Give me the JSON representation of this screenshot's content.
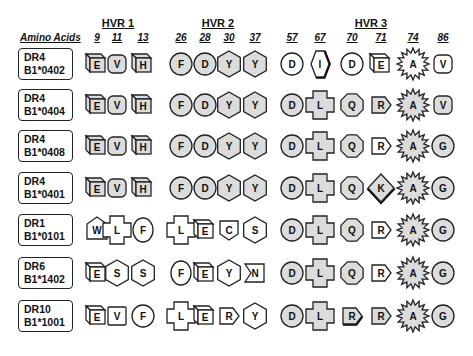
{
  "header": {
    "row_label_title": "Amino Acids",
    "regions": [
      {
        "label": "HVR 1",
        "x": 118
      },
      {
        "label": "HVR 2",
        "x": 218
      },
      {
        "label": "HVR 3",
        "x": 371
      }
    ],
    "positions": [
      {
        "label": "9",
        "x": 97
      },
      {
        "label": "11",
        "x": 117
      },
      {
        "label": "13",
        "x": 143
      },
      {
        "label": "26",
        "x": 181
      },
      {
        "label": "28",
        "x": 205
      },
      {
        "label": "30",
        "x": 229
      },
      {
        "label": "37",
        "x": 255
      },
      {
        "label": "57",
        "x": 292
      },
      {
        "label": "67",
        "x": 320
      },
      {
        "label": "70",
        "x": 352
      },
      {
        "label": "71",
        "x": 381
      },
      {
        "label": "74",
        "x": 413
      },
      {
        "label": "86",
        "x": 443
      }
    ]
  },
  "colors": {
    "shaded_fill": "#dcdcdc",
    "unshaded_fill": "#ffffff",
    "stroke": "#222222"
  },
  "alleles": [
    {
      "line1": "DR4",
      "line2": "B1*0402",
      "residues": [
        {
          "aa": "E",
          "shape": "cube",
          "shaded": true
        },
        {
          "aa": "V",
          "shape": "rounded",
          "shaded": true
        },
        {
          "aa": "H",
          "shape": "cube",
          "shaded": true
        },
        {
          "aa": "F",
          "shape": "circle",
          "shaded": true
        },
        {
          "aa": "D",
          "shape": "circle",
          "shaded": true
        },
        {
          "aa": "Y",
          "shape": "hexagon",
          "shaded": true
        },
        {
          "aa": "Y",
          "shape": "hexagon",
          "shaded": true
        },
        {
          "aa": "D",
          "shape": "circle",
          "shaded": false
        },
        {
          "aa": "I",
          "shape": "hexagon-bold",
          "shaded": false
        },
        {
          "aa": "D",
          "shape": "circle",
          "shaded": false
        },
        {
          "aa": "E",
          "shape": "cube",
          "shaded": false
        },
        {
          "aa": "A",
          "shape": "starburst",
          "shaded": false
        },
        {
          "aa": "V",
          "shape": "rounded",
          "shaded": false
        }
      ]
    },
    {
      "line1": "DR4",
      "line2": "B1*0404",
      "residues": [
        {
          "aa": "E",
          "shape": "cube",
          "shaded": true
        },
        {
          "aa": "V",
          "shape": "rounded",
          "shaded": true
        },
        {
          "aa": "H",
          "shape": "cube",
          "shaded": true
        },
        {
          "aa": "F",
          "shape": "circle",
          "shaded": true
        },
        {
          "aa": "D",
          "shape": "circle",
          "shaded": true
        },
        {
          "aa": "Y",
          "shape": "hexagon",
          "shaded": true
        },
        {
          "aa": "Y",
          "shape": "hexagon",
          "shaded": true
        },
        {
          "aa": "D",
          "shape": "circle",
          "shaded": true
        },
        {
          "aa": "L",
          "shape": "cross",
          "shaded": true
        },
        {
          "aa": "Q",
          "shape": "octagon",
          "shaded": true
        },
        {
          "aa": "R",
          "shape": "pentagon-arrow",
          "shaded": true
        },
        {
          "aa": "A",
          "shape": "starburst",
          "shaded": true
        },
        {
          "aa": "V",
          "shape": "rounded",
          "shaded": true
        }
      ]
    },
    {
      "line1": "DR4",
      "line2": "B1*0408",
      "residues": [
        {
          "aa": "E",
          "shape": "cube",
          "shaded": true
        },
        {
          "aa": "V",
          "shape": "rounded",
          "shaded": true
        },
        {
          "aa": "H",
          "shape": "cube",
          "shaded": true
        },
        {
          "aa": "F",
          "shape": "circle",
          "shaded": true
        },
        {
          "aa": "D",
          "shape": "circle",
          "shaded": true
        },
        {
          "aa": "Y",
          "shape": "hexagon",
          "shaded": true
        },
        {
          "aa": "Y",
          "shape": "hexagon",
          "shaded": true
        },
        {
          "aa": "D",
          "shape": "circle",
          "shaded": true
        },
        {
          "aa": "L",
          "shape": "cross",
          "shaded": true
        },
        {
          "aa": "Q",
          "shape": "octagon",
          "shaded": true
        },
        {
          "aa": "R",
          "shape": "pentagon-arrow",
          "shaded": false
        },
        {
          "aa": "A",
          "shape": "starburst",
          "shaded": true
        },
        {
          "aa": "G",
          "shape": "circle",
          "shaded": true
        }
      ]
    },
    {
      "line1": "DR4",
      "line2": "B1*0401",
      "residues": [
        {
          "aa": "E",
          "shape": "cube",
          "shaded": true
        },
        {
          "aa": "V",
          "shape": "rounded",
          "shaded": true
        },
        {
          "aa": "H",
          "shape": "cube",
          "shaded": true
        },
        {
          "aa": "F",
          "shape": "circle",
          "shaded": true
        },
        {
          "aa": "D",
          "shape": "circle",
          "shaded": true
        },
        {
          "aa": "Y",
          "shape": "hexagon",
          "shaded": true
        },
        {
          "aa": "Y",
          "shape": "hexagon",
          "shaded": true
        },
        {
          "aa": "D",
          "shape": "circle",
          "shaded": true
        },
        {
          "aa": "L",
          "shape": "cross",
          "shaded": true
        },
        {
          "aa": "Q",
          "shape": "octagon",
          "shaded": true
        },
        {
          "aa": "K",
          "shape": "diamond-bold",
          "shaded": true
        },
        {
          "aa": "A",
          "shape": "starburst",
          "shaded": true
        },
        {
          "aa": "G",
          "shape": "circle",
          "shaded": true
        }
      ]
    },
    {
      "line1": "DR1",
      "line2": "B1*0101",
      "residues": [
        {
          "aa": "W",
          "shape": "pentagon-house",
          "shaded": false
        },
        {
          "aa": "L",
          "shape": "cross",
          "shaded": false
        },
        {
          "aa": "F",
          "shape": "oval",
          "shaded": false
        },
        {
          "aa": "L",
          "shape": "cross",
          "shaded": false
        },
        {
          "aa": "E",
          "shape": "cube",
          "shaded": false
        },
        {
          "aa": "C",
          "shape": "pentagon-down",
          "shaded": false
        },
        {
          "aa": "S",
          "shape": "hexagon",
          "shaded": false
        },
        {
          "aa": "D",
          "shape": "circle",
          "shaded": true
        },
        {
          "aa": "L",
          "shape": "cross",
          "shaded": true
        },
        {
          "aa": "Q",
          "shape": "octagon",
          "shaded": true
        },
        {
          "aa": "R",
          "shape": "pentagon-arrow",
          "shaded": false
        },
        {
          "aa": "A",
          "shape": "starburst",
          "shaded": true
        },
        {
          "aa": "G",
          "shape": "circle",
          "shaded": true
        }
      ]
    },
    {
      "line1": "DR6",
      "line2": "B1*1402",
      "residues": [
        {
          "aa": "E",
          "shape": "cube",
          "shaded": false
        },
        {
          "aa": "S",
          "shape": "hexagon",
          "shaded": false
        },
        {
          "aa": "S",
          "shape": "hexagon",
          "shaded": false
        },
        {
          "aa": "F",
          "shape": "oval",
          "shaded": false
        },
        {
          "aa": "E",
          "shape": "cube",
          "shaded": false
        },
        {
          "aa": "Y",
          "shape": "hexagon",
          "shaded": false
        },
        {
          "aa": "N",
          "shape": "notch-left",
          "shaded": false
        },
        {
          "aa": "D",
          "shape": "circle",
          "shaded": true
        },
        {
          "aa": "L",
          "shape": "cross",
          "shaded": true
        },
        {
          "aa": "Q",
          "shape": "octagon",
          "shaded": true
        },
        {
          "aa": "R",
          "shape": "pentagon-arrow",
          "shaded": false
        },
        {
          "aa": "A",
          "shape": "starburst",
          "shaded": true
        },
        {
          "aa": "G",
          "shape": "circle",
          "shaded": true
        }
      ]
    },
    {
      "line1": "DR10",
      "line2": "B1*1001",
      "residues": [
        {
          "aa": "E",
          "shape": "cube",
          "shaded": false
        },
        {
          "aa": "V",
          "shape": "square",
          "shaded": false
        },
        {
          "aa": "F",
          "shape": "circle",
          "shaded": false
        },
        {
          "aa": "L",
          "shape": "cross",
          "shaded": false
        },
        {
          "aa": "E",
          "shape": "cube",
          "shaded": false
        },
        {
          "aa": "R",
          "shape": "pentagon-arrow",
          "shaded": false
        },
        {
          "aa": "Y",
          "shape": "hexagon",
          "shaded": false
        },
        {
          "aa": "D",
          "shape": "circle",
          "shaded": true
        },
        {
          "aa": "L",
          "shape": "cross",
          "shaded": true
        },
        {
          "aa": "R",
          "shape": "pentagon-arrow-bold",
          "shaded": true
        },
        {
          "aa": "R",
          "shape": "pentagon-arrow",
          "shaded": true
        },
        {
          "aa": "A",
          "shape": "starburst",
          "shaded": true
        },
        {
          "aa": "G",
          "shape": "circle",
          "shaded": true
        }
      ]
    }
  ],
  "row_centers": [
    64,
    105,
    146,
    188,
    230,
    273,
    316
  ]
}
